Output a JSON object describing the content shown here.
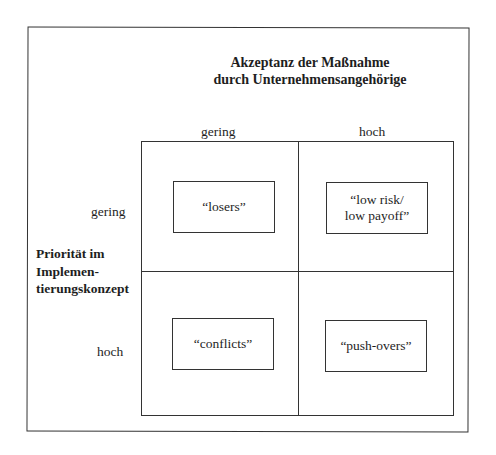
{
  "title": {
    "line1": "Akzeptanz der Maßnahme",
    "line2": "durch Unternehmensangehörige"
  },
  "columns": {
    "low": "gering",
    "high": "hoch"
  },
  "rows": {
    "low": "gering",
    "high": "hoch"
  },
  "row_axis": {
    "line1": "Priorität im",
    "line2": "Implemen-",
    "line3": "tierungskonzept"
  },
  "cells": {
    "top_left": "“losers”",
    "top_right_line1": "“low risk/",
    "top_right_line2": "low payoff”",
    "bottom_left": "“conflicts”",
    "bottom_right": "“push-overs”"
  }
}
